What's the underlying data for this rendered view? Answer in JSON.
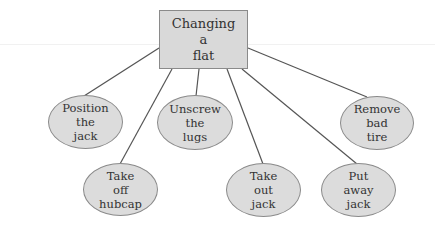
{
  "diagram": {
    "type": "tree",
    "root": {
      "lines": [
        "Changing",
        "a",
        "flat"
      ]
    },
    "children": [
      {
        "id": "position",
        "lines": [
          "Position",
          "the",
          "jack"
        ]
      },
      {
        "id": "hubcap",
        "lines": [
          "Take",
          "off",
          "hubcap"
        ]
      },
      {
        "id": "unscrew",
        "lines": [
          "Unscrew",
          "the",
          "lugs"
        ]
      },
      {
        "id": "takeout",
        "lines": [
          "Take",
          "out",
          "jack"
        ]
      },
      {
        "id": "putaway",
        "lines": [
          "Put",
          "away",
          "jack"
        ]
      },
      {
        "id": "remove",
        "lines": [
          "Remove",
          "bad",
          "tire"
        ]
      }
    ],
    "colors": {
      "node_fill": "#dcdcdc",
      "root_fill": "#d9d9d9",
      "stroke": "#8a8a8a",
      "edge": "#555555"
    }
  }
}
